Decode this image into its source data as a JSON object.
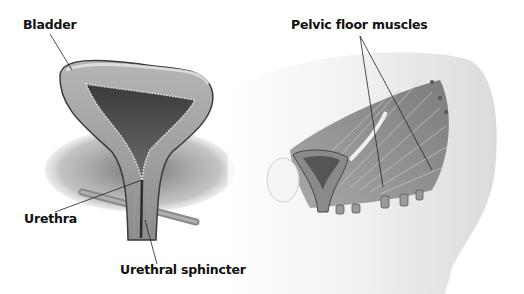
{
  "figure": {
    "left_panel": {
      "subject": "bladder-cross-section",
      "labels": {
        "bladder": "Bladder",
        "urethra": "Urethra",
        "urethral_sphincter": "Urethral sphincter"
      }
    },
    "right_panel": {
      "subject": "pelvis-side-view",
      "labels": {
        "pelvic_floor_muscles": "Pelvic floor muscles"
      }
    },
    "colors": {
      "background": "#ffffff",
      "label_text": "#111111",
      "leader_line": "#222222",
      "tissue_dark": "#4a4a4a",
      "tissue_mid": "#8a8a8a",
      "tissue_light": "#c8c8c8",
      "skin": "#e4e4e4"
    }
  }
}
